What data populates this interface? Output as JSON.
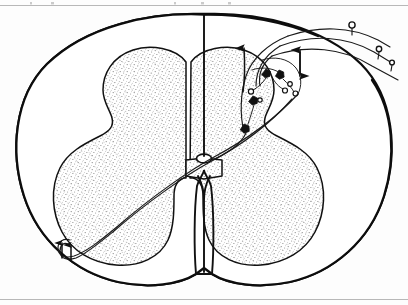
{
  "figure": {
    "alt_text": "Line drawing of a transverse section of the spinal cord showing stippled butterfly-shaped gray matter, central canal, dorsal and ventral horns, three afferent fibers entering the dorsal root entry zone at upper right, interneurons with synaptic boutons in the dorsal horn, and two fibers decussating to ascend in the contralateral anterolateral funiculus.",
    "style": "black ink line drawing, stippled shading, scanned book plate",
    "has_text_labels": false,
    "colors": {
      "background": "#fdfdfd",
      "ink": "#111111",
      "stipple": "#8d8d8d",
      "page_rule": "#b8b8b8",
      "white_matter_fill": "#ffffff",
      "gray_matter_fill": "#ffffff"
    }
  },
  "page": {
    "top_rule": "horizontal scan rule",
    "bottom_rule": "horizontal scan rule"
  },
  "anatomy": {
    "parts": [
      {
        "id": "cord-outline",
        "label": "Spinal cord outer boundary (pia mater)"
      },
      {
        "id": "white-matter",
        "label": "White matter funiculi"
      },
      {
        "id": "gray-matter",
        "label": "Gray matter (butterfly / H-shaped)"
      },
      {
        "id": "dorsal-horn-left",
        "label": "Left dorsal (posterior) horn"
      },
      {
        "id": "dorsal-horn-right",
        "label": "Right dorsal (posterior) horn"
      },
      {
        "id": "ventral-horn-left",
        "label": "Left ventral (anterior) horn"
      },
      {
        "id": "ventral-horn-right",
        "label": "Right ventral (anterior) horn"
      },
      {
        "id": "central-canal",
        "label": "Central canal"
      },
      {
        "id": "dorsal-median-septum",
        "label": "Dorsal median septum"
      },
      {
        "id": "ventral-median-fissure",
        "label": "Anterior median fissure"
      },
      {
        "id": "gray-commissure",
        "label": "Gray commissure"
      }
    ]
  },
  "circuit": {
    "afferent_fibers": [
      {
        "id": "afferent-1",
        "label": "Primary afferent fiber 1",
        "terminal": "receptor ending"
      },
      {
        "id": "afferent-2",
        "label": "Primary afferent fiber 2",
        "terminal": "receptor ending"
      },
      {
        "id": "afferent-3",
        "label": "Primary afferent fiber 3",
        "terminal": "receptor ending"
      }
    ],
    "neurons": [
      {
        "id": "interneuron-1",
        "label": "Dorsal horn interneuron"
      },
      {
        "id": "interneuron-2",
        "label": "Dorsal horn interneuron"
      },
      {
        "id": "interneuron-3",
        "label": "Dorsal horn interneuron"
      },
      {
        "id": "projection-neuron",
        "label": "Projection neuron of ascending tract"
      }
    ],
    "arrows": [
      {
        "id": "ascending-arrow-dorsal",
        "label": "Ascending arrow in dorsal column",
        "direction": "up"
      },
      {
        "id": "bidirectional-arrow",
        "label": "Bidirectional arrow at root entry zone",
        "direction": "up-down"
      },
      {
        "id": "ascending-arrow-left-1",
        "label": "Ascending arrow in contralateral anterolateral funiculus",
        "direction": "up"
      },
      {
        "id": "ascending-arrow-left-2",
        "label": "Ascending arrow in contralateral anterolateral funiculus",
        "direction": "up"
      }
    ],
    "decussation": {
      "id": "decussating-fibers",
      "label": "Fibers crossing through the ventral white commissure to the contralateral side",
      "count": 2
    }
  }
}
